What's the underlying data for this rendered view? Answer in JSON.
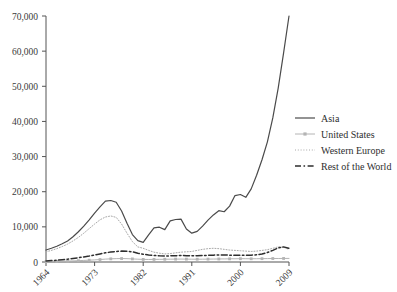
{
  "chart_data": {
    "type": "line",
    "title": "",
    "xlabel": "",
    "ylabel": "",
    "xlim": [
      1964,
      2009
    ],
    "ylim": [
      0,
      70000
    ],
    "grid": false,
    "legend_position": "right",
    "ytick_labels": [
      "0",
      "10,000",
      "20,000",
      "30,000",
      "40,000",
      "50,000",
      "60,000",
      "70,000"
    ],
    "ytick_values": [
      0,
      10000,
      20000,
      30000,
      40000,
      50000,
      60000,
      70000
    ],
    "xtick_labels": [
      "1964",
      "1973",
      "1982",
      "1991",
      "2000",
      "2009"
    ],
    "xtick_values": [
      1964,
      1973,
      1982,
      1991,
      2000,
      2009
    ],
    "x": [
      1964,
      1965,
      1966,
      1967,
      1968,
      1969,
      1970,
      1971,
      1972,
      1973,
      1974,
      1975,
      1976,
      1977,
      1978,
      1979,
      1980,
      1981,
      1982,
      1983,
      1984,
      1985,
      1986,
      1987,
      1988,
      1989,
      1990,
      1991,
      1992,
      1993,
      1994,
      1995,
      1996,
      1997,
      1998,
      1999,
      2000,
      2001,
      2002,
      2003,
      2004,
      2005,
      2006,
      2007,
      2008,
      2009
    ],
    "series": [
      {
        "name": "Asia",
        "style": "solid",
        "color": "#4a4a4a",
        "values": [
          3400,
          3900,
          4500,
          5200,
          6000,
          7200,
          8600,
          10200,
          12000,
          13900,
          15700,
          17300,
          17500,
          17000,
          14500,
          11000,
          7800,
          6100,
          5600,
          7700,
          9700,
          9900,
          9200,
          11700,
          12100,
          12200,
          9400,
          8200,
          8700,
          10200,
          11900,
          13400,
          14600,
          14300,
          15900,
          18900,
          19200,
          18400,
          20800,
          24700,
          29100,
          34200,
          41000,
          49500,
          59500,
          70000
        ]
      },
      {
        "name": "United States",
        "style": "solid-marker",
        "color": "#b4b4b4",
        "values": [
          100,
          130,
          170,
          210,
          260,
          310,
          380,
          450,
          520,
          600,
          700,
          820,
          900,
          960,
          980,
          950,
          880,
          800,
          740,
          720,
          740,
          760,
          780,
          800,
          820,
          830,
          820,
          800,
          790,
          800,
          820,
          840,
          860,
          880,
          900,
          920,
          940,
          930,
          920,
          930,
          950,
          970,
          990,
          1000,
          1010,
          1020
        ]
      },
      {
        "name": "Western Europe",
        "style": "dotted",
        "color": "#a8a8a8",
        "values": [
          2900,
          3300,
          3800,
          4400,
          5100,
          6000,
          7000,
          8200,
          9500,
          10800,
          12000,
          12800,
          13100,
          12700,
          10800,
          8200,
          5800,
          4300,
          3900,
          3300,
          2800,
          2500,
          2300,
          2400,
          2600,
          2800,
          2900,
          3000,
          3300,
          3600,
          3800,
          3900,
          3800,
          3600,
          3400,
          3300,
          3200,
          3100,
          3000,
          3100,
          3300,
          3500,
          3900,
          4300,
          4200,
          3600
        ]
      },
      {
        "name": "Rest of the World",
        "style": "dash-dot",
        "color": "#2e2e2e",
        "values": [
          300,
          400,
          500,
          650,
          800,
          1000,
          1200,
          1450,
          1700,
          2000,
          2300,
          2600,
          2850,
          3000,
          3100,
          3050,
          2900,
          2500,
          2200,
          2000,
          1850,
          1750,
          1700,
          1750,
          1800,
          1850,
          1800,
          1750,
          1800,
          1850,
          1900,
          1950,
          2000,
          2000,
          1950,
          1900,
          1900,
          1900,
          1950,
          2050,
          2300,
          2700,
          3300,
          4000,
          4300,
          3900
        ]
      }
    ]
  },
  "legend": {
    "items": [
      {
        "label": "Asia"
      },
      {
        "label": "United States"
      },
      {
        "label": "Western Europe"
      },
      {
        "label": "Rest of the World"
      }
    ]
  },
  "colors": {
    "axis": "#555555",
    "text": "#3a3a3a",
    "asia": "#4a4a4a",
    "united_states": "#b4b4b4",
    "western_europe": "#a8a8a8",
    "rest_of_world": "#2e2e2e",
    "background": "#ffffff"
  }
}
